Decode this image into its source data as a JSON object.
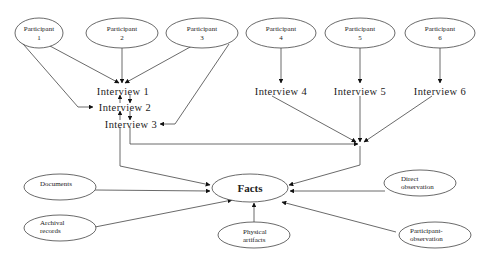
{
  "diagram": {
    "type": "flow",
    "participants": [
      {
        "id": "p1",
        "label_line1": "Participant",
        "label_line2": "1"
      },
      {
        "id": "p2",
        "label_line1": "Participant",
        "label_line2": "2"
      },
      {
        "id": "p3",
        "label_line1": "Participant",
        "label_line2": "3"
      },
      {
        "id": "p4",
        "label_line1": "Participant",
        "label_line2": "4"
      },
      {
        "id": "p5",
        "label_line1": "Participant",
        "label_line2": "5"
      },
      {
        "id": "p6",
        "label_line1": "Participant",
        "label_line2": "6"
      }
    ],
    "interviews": [
      {
        "id": "i1",
        "label": "Interview 1"
      },
      {
        "id": "i2",
        "label": "Interview 2"
      },
      {
        "id": "i3",
        "label": "Interview 3"
      },
      {
        "id": "i4",
        "label": "Interview 4"
      },
      {
        "id": "i5",
        "label": "Interview 5"
      },
      {
        "id": "i6",
        "label": "Interview 6"
      }
    ],
    "center": {
      "id": "facts",
      "label": "Facts"
    },
    "sources": [
      {
        "id": "documents",
        "label_line1": "Documents",
        "label_line2": ""
      },
      {
        "id": "archival",
        "label_line1": "Archival",
        "label_line2": "records"
      },
      {
        "id": "physical",
        "label_line1": "Physical",
        "label_line2": "artifacts"
      },
      {
        "id": "direct",
        "label_line1": "Direct",
        "label_line2": "observation"
      },
      {
        "id": "participant_obs",
        "label_line1": "Participant-",
        "label_line2": "observation"
      }
    ],
    "edges": [
      [
        "p1",
        "i1"
      ],
      [
        "p2",
        "i1"
      ],
      [
        "p3",
        "i1"
      ],
      [
        "p1",
        "i2"
      ],
      [
        "p3",
        "i3"
      ],
      [
        "i1",
        "i2"
      ],
      [
        "i2",
        "i1"
      ],
      [
        "i2",
        "i3"
      ],
      [
        "i3",
        "i2"
      ],
      [
        "p4",
        "i4"
      ],
      [
        "p5",
        "i5"
      ],
      [
        "p6",
        "i6"
      ],
      [
        "i4",
        "merge"
      ],
      [
        "i5",
        "merge"
      ],
      [
        "i6",
        "merge"
      ],
      [
        "i3",
        "merge"
      ],
      [
        "merge",
        "facts"
      ],
      [
        "i1",
        "facts"
      ],
      [
        "documents",
        "facts"
      ],
      [
        "archival",
        "facts"
      ],
      [
        "physical",
        "facts"
      ],
      [
        "direct",
        "facts"
      ],
      [
        "participant_obs",
        "facts"
      ]
    ]
  }
}
